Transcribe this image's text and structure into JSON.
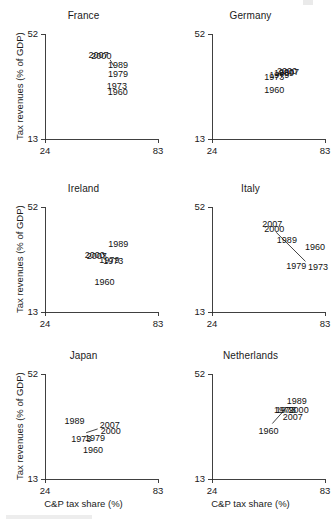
{
  "figure": {
    "layout": "2 columns x 3 rows of scatter panels",
    "background_color": "#ffffff",
    "axis_color": "#2b2b2b",
    "label_color": "#111111"
  },
  "axes": {
    "xlabel": "C&P tax share (%)",
    "ylabel": "Tax revenues (% of GDP)",
    "xticks": [
      "24",
      "83"
    ],
    "yticks": [
      "13",
      "52"
    ],
    "xlim": [
      24,
      83
    ],
    "ylim": [
      13,
      52
    ]
  },
  "chart_data": {
    "type": "scatter",
    "title": "",
    "xlabel": "C&P tax share (%)",
    "ylabel": "Tax revenues (% of GDP)",
    "xlim": [
      24,
      83
    ],
    "ylim": [
      13,
      52
    ],
    "xticks": [
      24,
      83
    ],
    "yticks": [
      13,
      52
    ],
    "grid": false,
    "legend": "none",
    "point_labels_are_years": true,
    "years": [
      1960,
      1973,
      1979,
      1989,
      2000,
      2007
    ],
    "panels": [
      {
        "name": "France",
        "row": 0,
        "col": 0,
        "points": [
          {
            "year": "1960",
            "x": 61.5,
            "y": 34.0,
            "label_dx": -9,
            "label_dy": 13
          },
          {
            "year": "1973",
            "x": 61.0,
            "y": 35.0,
            "label_dx": -9,
            "label_dy": 9
          },
          {
            "year": "1979",
            "x": 60.0,
            "y": 38.0,
            "label_dx": -6,
            "label_dy": 5
          },
          {
            "year": "1989",
            "x": 58.5,
            "y": 40.0,
            "label_dx": -3,
            "label_dy": 2
          },
          {
            "year": "2000",
            "x": 55.0,
            "y": 42.5,
            "label_dx": -13,
            "label_dy": -1
          },
          {
            "year": "2007",
            "x": 54.5,
            "y": 42.8,
            "label_dx": -15,
            "label_dy": -1
          }
        ],
        "connector": {
          "x1": 58.0,
          "y1": 42.4,
          "x2": 60.0,
          "y2": 40.0
        }
      },
      {
        "name": "Germany",
        "row": 0,
        "col": 1,
        "points": [
          {
            "year": "1960",
            "x": 56.0,
            "y": 33.5,
            "label_dx": -9,
            "label_dy": 9
          },
          {
            "year": "1973",
            "x": 56.5,
            "y": 36.0,
            "label_dx": -10,
            "label_dy": 3
          },
          {
            "year": "1979",
            "x": 57.5,
            "y": 36.6,
            "label_dx": -7,
            "label_dy": 3
          },
          {
            "year": "1989",
            "x": 58.5,
            "y": 36.8,
            "label_dx": -4,
            "label_dy": 1
          },
          {
            "year": "2000",
            "x": 59.0,
            "y": 37.2,
            "label_dx": -2,
            "label_dy": 0
          },
          {
            "year": "2007",
            "x": 59.5,
            "y": 37.0,
            "label_dx": -1,
            "label_dy": 1
          }
        ],
        "connector": null
      },
      {
        "name": "Ireland",
        "row": 1,
        "col": 0,
        "points": [
          {
            "year": "1960",
            "x": 53.0,
            "y": 29.0,
            "label_dx": -6,
            "label_dy": 16
          },
          {
            "year": "1973",
            "x": 55.5,
            "y": 33.2,
            "label_dx": -2,
            "label_dy": 6
          },
          {
            "year": "1979",
            "x": 55.0,
            "y": 33.4,
            "label_dx": -5,
            "label_dy": 6
          },
          {
            "year": "1989",
            "x": 56.5,
            "y": 36.0,
            "label_dx": 1,
            "label_dy": -3
          },
          {
            "year": "2000",
            "x": 51.5,
            "y": 34.2,
            "label_dx": -13,
            "label_dy": 3
          },
          {
            "year": "2007",
            "x": 52.0,
            "y": 34.0,
            "label_dx": -12,
            "label_dy": 4
          }
        ],
        "connector": {
          "x1": 54.0,
          "y1": 34.6,
          "x2": 56.0,
          "y2": 33.6
        }
      },
      {
        "name": "Italy",
        "row": 1,
        "col": 1,
        "points": [
          {
            "year": "1960",
            "x": 71.0,
            "y": 37.0,
            "label_dx": 3,
            "label_dy": 3
          },
          {
            "year": "1973",
            "x": 72.5,
            "y": 31.5,
            "label_dx": 3,
            "label_dy": 8
          },
          {
            "year": "1979",
            "x": 67.5,
            "y": 32.0,
            "label_dx": -9,
            "label_dy": 8
          },
          {
            "year": "1989",
            "x": 61.0,
            "y": 39.0,
            "label_dx": -6,
            "label_dy": 1
          },
          {
            "year": "2000",
            "x": 56.5,
            "y": 42.5,
            "label_dx": -10,
            "label_dy": -1
          },
          {
            "year": "2007",
            "x": 56.0,
            "y": 43.5,
            "label_dx": -11,
            "label_dy": -3
          }
        ],
        "connector": {
          "x1": 57.5,
          "y1": 42.6,
          "x2": 72.8,
          "y2": 31.8
        }
      },
      {
        "name": "Japan",
        "row": 2,
        "col": 0,
        "points": [
          {
            "year": "1960",
            "x": 47.0,
            "y": 27.5,
            "label_dx": -6,
            "label_dy": 13
          },
          {
            "year": "1973",
            "x": 44.0,
            "y": 29.5,
            "label_dx": -12,
            "label_dy": 7
          },
          {
            "year": "1979",
            "x": 47.5,
            "y": 29.8,
            "label_dx": -5,
            "label_dy": 7
          },
          {
            "year": "1989",
            "x": 42.0,
            "y": 33.0,
            "label_dx": -15,
            "label_dy": -1
          },
          {
            "year": "2000",
            "x": 52.0,
            "y": 31.2,
            "label_dx": 2,
            "label_dy": 4
          },
          {
            "year": "2007",
            "x": 51.5,
            "y": 32.2,
            "label_dx": 2,
            "label_dy": 1
          }
        ],
        "connector": {
          "x1": 45.5,
          "y1": 30.2,
          "x2": 51.5,
          "y2": 31.6
        }
      },
      {
        "name": "Netherlands",
        "row": 2,
        "col": 1,
        "points": [
          {
            "year": "1960",
            "x": 54.0,
            "y": 33.0,
            "label_dx": -11,
            "label_dy": 9
          },
          {
            "year": "1973",
            "x": 61.0,
            "y": 38.5,
            "label_dx": -7,
            "label_dy": 3
          },
          {
            "year": "1979",
            "x": 60.5,
            "y": 38.8,
            "label_dx": -8,
            "label_dy": 3
          },
          {
            "year": "1989",
            "x": 63.5,
            "y": 40.5,
            "label_dx": -1,
            "label_dy": -1
          },
          {
            "year": "2000",
            "x": 64.0,
            "y": 38.6,
            "label_dx": 0,
            "label_dy": 3
          },
          {
            "year": "2007",
            "x": 62.5,
            "y": 37.2,
            "label_dx": -3,
            "label_dy": 6
          }
        ],
        "connector": {
          "x1": 55.5,
          "y1": 33.6,
          "x2": 63.0,
          "y2": 39.6
        }
      }
    ]
  }
}
